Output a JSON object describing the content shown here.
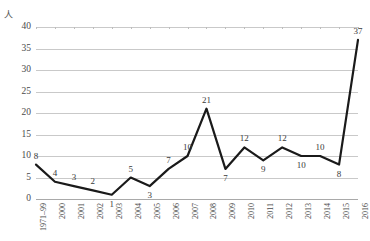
{
  "clipped_header_text": "",
  "unit_label": "人",
  "chart_data": {
    "type": "line",
    "title": "",
    "subtitle": "",
    "xlabel": "",
    "ylabel": "人",
    "categories": [
      "1971–99",
      "2000",
      "2001",
      "2002",
      "2003",
      "2004",
      "2005",
      "2006",
      "2007",
      "2008",
      "2009",
      "2010",
      "2011",
      "2012",
      "2013",
      "2014",
      "2015",
      "2016"
    ],
    "values": [
      8,
      4,
      3,
      2,
      1,
      5,
      3,
      7,
      10,
      21,
      7,
      12,
      9,
      12,
      10,
      10,
      8,
      37
    ],
    "data_labels": [
      "8",
      "4",
      "3",
      "2",
      "1",
      "5",
      "3",
      "7",
      "10",
      "21",
      "7",
      "12",
      "9",
      "12",
      "10",
      "10",
      "8",
      "37"
    ],
    "ylim": [
      0,
      40
    ],
    "yticks": [
      "0",
      "5",
      "10",
      "15",
      "20",
      "25",
      "30",
      "35",
      "40"
    ],
    "ytick_values": [
      0,
      5,
      10,
      15,
      20,
      25,
      30,
      35,
      40
    ],
    "grid": true,
    "legend": null,
    "legend_position": "none",
    "series": [
      {
        "name": "人",
        "values": [
          8,
          4,
          3,
          2,
          1,
          5,
          3,
          7,
          10,
          21,
          7,
          12,
          9,
          12,
          10,
          10,
          8,
          37
        ],
        "color": "#1a1a1a",
        "line_width": 2.2,
        "markers": false
      }
    ],
    "annotations": [],
    "colors": {
      "line": "#1a1a1a",
      "grid": "#c9c9c9",
      "axis": "#a9a9a9",
      "text": "#3f3f3f",
      "background": "#ffffff"
    }
  }
}
